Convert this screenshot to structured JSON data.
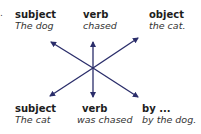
{
  "colors": {
    "arrow": "#2a2d6a",
    "text": "#222222",
    "background": "#ffffff"
  },
  "top": {
    "subject": {
      "head": "subject",
      "sub": "The dog"
    },
    "verb": {
      "head": "verb",
      "sub": "chased"
    },
    "object": {
      "head": "object",
      "sub": "the cat."
    }
  },
  "bottom": {
    "subject": {
      "head": "subject",
      "sub": "The cat"
    },
    "verb": {
      "head": "verb",
      "sub": "was chased"
    },
    "agent": {
      "head": "by ...",
      "sub": "by the dog."
    }
  },
  "fragments": {
    "left_period": "."
  }
}
